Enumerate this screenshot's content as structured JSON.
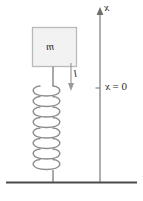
{
  "figure": {
    "colors": {
      "stroke": "#8c8c8c",
      "axis": "#8c8c8c",
      "ground": "#4d4d4d",
      "block_fill": "#f2f2f2",
      "block_border": "#b3b3b3",
      "text": "#2b2b2b",
      "background": "#ffffff"
    },
    "labels": {
      "axis": "x",
      "mass": "m",
      "length": "l",
      "origin_prefix": "0 = ",
      "origin_var": "x",
      "origin_full": "0 = x"
    },
    "elements": {
      "mass_block": "mass-block",
      "spring": "helical-spring",
      "ground": "ground-line",
      "axis": "vertical-axis",
      "axis_arrow": "axis-arrow-up",
      "axis_tick": "axis-tick-origin",
      "length_arrow": "length-arrow-down",
      "connector_top": "block-to-spring-connector",
      "connector_bottom": "spring-to-ground-connector"
    },
    "geometry": {
      "axis_x": 100,
      "axis_top": 10,
      "axis_bottom": 182,
      "tick_y": 88,
      "ground_y": 182,
      "block": {
        "x": 32,
        "y": 27,
        "w": 45,
        "h": 40
      },
      "spring": {
        "left": 30,
        "right": 63,
        "top": 88,
        "bottom": 172,
        "coils": 8
      },
      "length_arrow": {
        "x": 71,
        "y_from": 63,
        "y_to": 90
      }
    }
  }
}
